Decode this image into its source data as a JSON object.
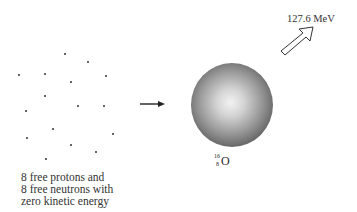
{
  "diagram": {
    "particles": {
      "count": 16,
      "points": [
        [
          65,
          54
        ],
        [
          88,
          62
        ],
        [
          19,
          75
        ],
        [
          45,
          74
        ],
        [
          106,
          76
        ],
        [
          71,
          82
        ],
        [
          45,
          96
        ],
        [
          26,
          111
        ],
        [
          78,
          106
        ],
        [
          104,
          106
        ],
        [
          53,
          129
        ],
        [
          113,
          134
        ],
        [
          27,
          138
        ],
        [
          71,
          145
        ],
        [
          96,
          152
        ],
        [
          46,
          159
        ]
      ]
    },
    "caption_lines": [
      "8 free protons and",
      "8 free neutrons with",
      "zero kinetic energy"
    ],
    "process_arrow": "right-arrow",
    "nucleus": {
      "mass_number": "16",
      "atomic_number": "8",
      "symbol": "O"
    },
    "energy_release": {
      "label": "127.6 MeV",
      "arrow": "hollow-up-right-arrow"
    },
    "colors": {
      "ink": "#333333",
      "sphere_center": "#f2f2f2",
      "sphere_edge": "#3a3a3a"
    }
  }
}
